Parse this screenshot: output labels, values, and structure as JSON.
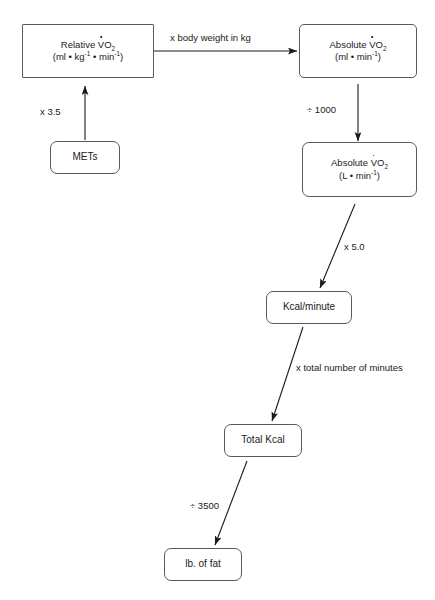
{
  "diagram": {
    "type": "flowchart",
    "theme": {
      "background": "#ffffff",
      "box_stroke": "#5a5a5a",
      "arrow_stroke": "#1a1a1a",
      "text_color": "#1a1a1a"
    },
    "nodes": [
      {
        "id": "relative-vo2",
        "line1_pre": "Relative ",
        "line1_v": "V",
        "line1_o": "O",
        "line1_sub": "2",
        "line2_a": "(ml • kg",
        "line2_sup1": "-1",
        "line2_b": " • min",
        "line2_sup2": "-1",
        "line2_c": ")",
        "plain": "Relative VO2 (ml • kg-1 • min-1)"
      },
      {
        "id": "absolute-vo2-ml",
        "line1_pre": "Absolute ",
        "line1_v": "V",
        "line1_o": "O",
        "line1_sub": "2",
        "line2_a": "(ml • min",
        "line2_sup2": "-1",
        "line2_c": ")",
        "plain": "Absolute VO2 (ml • min-1)"
      },
      {
        "id": "mets",
        "label": "METs"
      },
      {
        "id": "absolute-vo2-l",
        "line1_pre": "Absolute ",
        "line1_v": "V",
        "line1_o": "O",
        "line1_sub": "2",
        "line2_a": "(L • min",
        "line2_sup2": "-1",
        "line2_c": ")",
        "plain": "Absolute VO2 (L • min-1)"
      },
      {
        "id": "kcal-per-minute",
        "label": "Kcal/minute"
      },
      {
        "id": "total-kcal",
        "label": "Total Kcal"
      },
      {
        "id": "lb-of-fat",
        "label": "lb. of fat"
      }
    ],
    "edges": [
      {
        "id": "mets-to-relative",
        "from": "mets",
        "to": "relative-vo2",
        "label": "x 3.5"
      },
      {
        "id": "relative-to-absolute-ml",
        "from": "relative-vo2",
        "to": "absolute-vo2-ml",
        "label": "x body weight in kg"
      },
      {
        "id": "absolute-ml-to-absolute-l",
        "from": "absolute-vo2-ml",
        "to": "absolute-vo2-l",
        "label": "÷ 1000"
      },
      {
        "id": "absolute-l-to-kcal",
        "from": "absolute-vo2-l",
        "to": "kcal-per-minute",
        "label": "x 5.0"
      },
      {
        "id": "kcal-to-total-kcal",
        "from": "kcal-per-minute",
        "to": "total-kcal",
        "label": "x total number of minutes"
      },
      {
        "id": "total-kcal-to-lb-fat",
        "from": "total-kcal",
        "to": "lb-of-fat",
        "label": "÷ 3500"
      }
    ]
  }
}
